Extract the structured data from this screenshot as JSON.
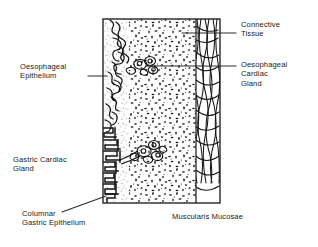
{
  "figure": {
    "type": "histology-line-diagram",
    "orientation": "epithelial surface at left, muscularis mucosae at right",
    "frame": {
      "left": 103,
      "top": 19,
      "right": 220,
      "bottom": 203
    }
  },
  "labels": {
    "connective_tissue": "Connective\nTissue",
    "oesophageal_cardiac_gland": "Oesophageal\nCardiac\nGland",
    "oesophageal_epithelium": "Oesophageal\nEpithelium",
    "gastric_cardiac_gland": "Gastric Cardiac\nGland",
    "columnar_gastric_epithelium": "Columnar\nGastric Epithelium",
    "muscularis_mucosae": "Muscularis Mucosae"
  },
  "leaders": [
    {
      "name": "connective-tissue-leader",
      "from": [
        236,
        33
      ],
      "to": [
        182,
        33
      ]
    },
    {
      "name": "oesophageal-cardiac-gland-leader",
      "from": [
        236,
        66
      ],
      "to": [
        146,
        66
      ]
    },
    {
      "name": "oesophageal-epithelium-leader",
      "from": [
        88,
        76
      ],
      "to": [
        106,
        76
      ]
    },
    {
      "name": "columnar-gastric-epithelium-leader",
      "from": [
        62,
        212
      ],
      "to": [
        106,
        196
      ]
    }
  ],
  "regions": {
    "oesophageal_epithelium": {
      "x_range": [
        103,
        128
      ],
      "pattern": "wavy-lobed-outline",
      "y_range": [
        19,
        128
      ]
    },
    "gastric_epithelium": {
      "x_range": [
        103,
        128
      ],
      "pattern": "angular-pits",
      "y_range": [
        128,
        203
      ]
    },
    "lamina_propria": {
      "x_range": [
        120,
        196
      ],
      "pattern": "stipple-dots"
    },
    "muscularis_mucosae": {
      "x_range": [
        196,
        220
      ],
      "pattern": "vertical-wavy-fibres"
    }
  },
  "colors": {
    "ink": "#1a1a1a",
    "background": "#ffffff",
    "leader_line": "#2b2b2b"
  }
}
